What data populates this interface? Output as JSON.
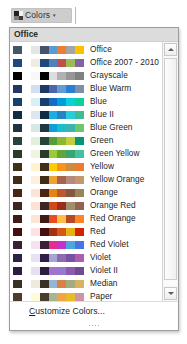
{
  "ribbon": {
    "colors_button_label": "Colors",
    "colors_button_icon": "color-palette-swatch-icon",
    "caret_icon": "chevron-down-icon"
  },
  "gallery": {
    "header": "Office",
    "scrollbar": {
      "up_icon": "scroll-up-arrow-icon",
      "down_icon": "scroll-down-arrow-icon"
    },
    "footer": {
      "customize_label": "Customize Colors...",
      "customize_accel": "C",
      "grip_icon": "resize-grip-icon"
    },
    "themes": [
      {
        "name": "Office",
        "colors": [
          "#44546a",
          "#ffffff",
          "#e7e6e6",
          "#44546a",
          "#5b9bd5",
          "#ed7d31",
          "#a5a5a5",
          "#ffc000"
        ]
      },
      {
        "name": "Office 2007 - 2010",
        "colors": [
          "#1f497d",
          "#ffffff",
          "#eeece1",
          "#1f497d",
          "#4f81bd",
          "#c0504d",
          "#9bbb59",
          "#8064a2"
        ]
      },
      {
        "name": "Grayscale",
        "colors": [
          "#000000",
          "#ffffff",
          "#f8f8f8",
          "#000000",
          "#dddddd",
          "#b2b2b2",
          "#969696",
          "#808080"
        ]
      },
      {
        "name": "Blue Warm",
        "colors": [
          "#1f3864",
          "#ffffff",
          "#d3dfee",
          "#1f3864",
          "#4a66ac",
          "#629dd1",
          "#297fd5",
          "#7f8fa9"
        ]
      },
      {
        "name": "Blue",
        "colors": [
          "#17406d",
          "#ffffff",
          "#dbeef4",
          "#17406d",
          "#0f6fc6",
          "#009dd9",
          "#0bd0d9",
          "#10cf9b"
        ]
      },
      {
        "name": "Blue II",
        "colors": [
          "#0f2c42",
          "#ffffff",
          "#dee6ef",
          "#0f2c42",
          "#1cade4",
          "#2683c6",
          "#27ced7",
          "#42ba97"
        ]
      },
      {
        "name": "Blue Green",
        "colors": [
          "#1d3641",
          "#ffffff",
          "#d8e6e4",
          "#1d3641",
          "#0f9ed5",
          "#17becf",
          "#3cb4ad",
          "#6dc66c"
        ]
      },
      {
        "name": "Green",
        "colors": [
          "#25453b",
          "#ffffff",
          "#e2efd9",
          "#25453b",
          "#549e39",
          "#8ab833",
          "#c0cf3a",
          "#029676"
        ]
      },
      {
        "name": "Green Yellow",
        "colors": [
          "#2c3b28",
          "#ffffff",
          "#eef3e2",
          "#2c3b28",
          "#99cb38",
          "#63a537",
          "#37a76f",
          "#44c1a3"
        ]
      },
      {
        "name": "Yellow",
        "colors": [
          "#3f3019",
          "#ffffff",
          "#fff2cc",
          "#3f3019",
          "#ffca08",
          "#f8931d",
          "#ce8d3e",
          "#ec7c30"
        ]
      },
      {
        "name": "Yellow Orange",
        "colors": [
          "#3f2d16",
          "#ffffff",
          "#fdf0e2",
          "#3f2d16",
          "#f0a22e",
          "#a5644e",
          "#b58b80",
          "#c3986d"
        ]
      },
      {
        "name": "Orange",
        "colors": [
          "#4a2511",
          "#ffffff",
          "#fbe5d6",
          "#4a2511",
          "#e48312",
          "#bd582c",
          "#865640",
          "#9b8357"
        ]
      },
      {
        "name": "Orange Red",
        "colors": [
          "#3e2723",
          "#ffffff",
          "#fbe2d5",
          "#3e2723",
          "#d34817",
          "#9b2d1f",
          "#a28e6a",
          "#956251"
        ]
      },
      {
        "name": "Red Orange",
        "colors": [
          "#3f1d16",
          "#ffffff",
          "#fce4d6",
          "#3f1d16",
          "#e84c22",
          "#ffbd47",
          "#b64926",
          "#ff8427"
        ]
      },
      {
        "name": "Red",
        "colors": [
          "#450f0f",
          "#ffffff",
          "#fce3e3",
          "#450f0f",
          "#a5300f",
          "#d55816",
          "#e8b113",
          "#d42300"
        ]
      },
      {
        "name": "Red Violet",
        "colors": [
          "#3b1f32",
          "#ffffff",
          "#f4e3ef",
          "#3b1f32",
          "#e32d91",
          "#c830cc",
          "#4ea6dc",
          "#4775e7"
        ]
      },
      {
        "name": "Violet",
        "colors": [
          "#2d2147",
          "#ffffff",
          "#e8e3f4",
          "#2d2147",
          "#a5a5d0",
          "#8c6bb1",
          "#7a50a1",
          "#ae5dab"
        ]
      },
      {
        "name": "Violet II",
        "colors": [
          "#2c1f3d",
          "#ffffff",
          "#e6e0ef",
          "#2c1f3d",
          "#a173d1",
          "#9479ce",
          "#8c5bb0",
          "#724a8f"
        ]
      },
      {
        "name": "Median",
        "colors": [
          "#3b3024",
          "#ffffff",
          "#eeeade",
          "#3b3024",
          "#94b6d2",
          "#dd8047",
          "#a5ab81",
          "#d8b25c"
        ]
      },
      {
        "name": "Paper",
        "colors": [
          "#4b3c2b",
          "#ffffff",
          "#fefcd8",
          "#4b3c2b",
          "#a5b592",
          "#f3a447",
          "#e7bc29",
          "#d092a7"
        ]
      },
      {
        "name": "Marquee",
        "colors": [
          "#1f3864",
          "#ffffff",
          "#dee1e6",
          "#1f3864",
          "#418ab3",
          "#a6b727",
          "#f69200",
          "#838383"
        ]
      }
    ]
  }
}
